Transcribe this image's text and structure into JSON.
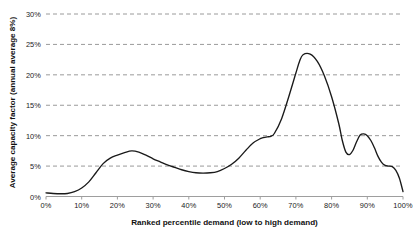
{
  "chart_data": {
    "type": "line",
    "title": "",
    "xlabel": "Ranked percentile demand (low to high demand)",
    "ylabel": "Average capacity factor (annual average 8%)",
    "xlim": [
      0,
      100
    ],
    "ylim": [
      0,
      30
    ],
    "grid": true,
    "grid_axis": "y",
    "grid_style": "dashed",
    "legend": "none",
    "line_color": "#1a1a1a",
    "grid_color": "#9a9a9a",
    "axis_color": "#999999",
    "background_color": "#ffffff",
    "x_tick_labels": [
      "0%",
      "10%",
      "20%",
      "30%",
      "40%",
      "50%",
      "60%",
      "70%",
      "80%",
      "90%",
      "100%"
    ],
    "x_tick_values": [
      0,
      10,
      20,
      30,
      40,
      50,
      60,
      70,
      80,
      90,
      100
    ],
    "y_tick_labels": [
      "0%",
      "5%",
      "10%",
      "15%",
      "20%",
      "25%",
      "30%"
    ],
    "y_tick_values": [
      0,
      5,
      10,
      15,
      20,
      25,
      30
    ],
    "series": [
      {
        "name": "Average capacity factor",
        "x": [
          0,
          2,
          4,
          6,
          8,
          10,
          12,
          14,
          16,
          18,
          20,
          22,
          24,
          26,
          28,
          30,
          32,
          34,
          36,
          38,
          40,
          42,
          44,
          46,
          48,
          50,
          52,
          54,
          56,
          58,
          60,
          61,
          62,
          63,
          64,
          66,
          68,
          70,
          71,
          72,
          74,
          76,
          78,
          80,
          82,
          83,
          84,
          85,
          86,
          87,
          88,
          89,
          90,
          91,
          92,
          93,
          94,
          95,
          96,
          97,
          98,
          99,
          100
        ],
        "y": [
          0.6,
          0.5,
          0.45,
          0.5,
          0.8,
          1.4,
          2.4,
          3.9,
          5.4,
          6.3,
          6.8,
          7.2,
          7.5,
          7.3,
          6.8,
          6.2,
          5.7,
          5.2,
          4.8,
          4.4,
          4.1,
          3.9,
          3.85,
          3.9,
          4.1,
          4.6,
          5.3,
          6.3,
          7.6,
          8.8,
          9.5,
          9.7,
          9.8,
          9.9,
          10.4,
          12.8,
          16.4,
          20.3,
          22.2,
          23.3,
          23.4,
          22.2,
          19.8,
          16.4,
          12.0,
          9.2,
          7.3,
          6.9,
          7.6,
          9.0,
          10.1,
          10.3,
          10.0,
          9.2,
          8.0,
          6.6,
          5.6,
          5.1,
          5.0,
          4.9,
          4.3,
          3.0,
          0.8
        ]
      }
    ],
    "annotations": {
      "peak_value": "23.4%",
      "peak_x": "74%",
      "first_hump_value": "7.5%",
      "first_hump_x": "24%",
      "valley_value": "3.85%",
      "valley_x": "44%",
      "second_bump_value": "10.3%",
      "second_bump_x": "89%"
    }
  }
}
